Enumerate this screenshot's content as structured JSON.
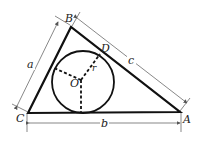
{
  "diagram": {
    "vertices": {
      "A": {
        "label": "A",
        "x": 180,
        "y": 112
      },
      "B": {
        "label": "B",
        "x": 71,
        "y": 27
      },
      "C": {
        "label": "C",
        "x": 28,
        "y": 113
      }
    },
    "incircle": {
      "center_label": "O",
      "cx": 83,
      "cy": 82,
      "r": 31,
      "radius_label": "r"
    },
    "tangent_point": {
      "label": "D"
    },
    "side_labels": {
      "a": "a",
      "b": "b",
      "c": "c"
    },
    "colors": {
      "stroke": "#111111",
      "dim": "#555555",
      "background": "#ffffff"
    }
  }
}
